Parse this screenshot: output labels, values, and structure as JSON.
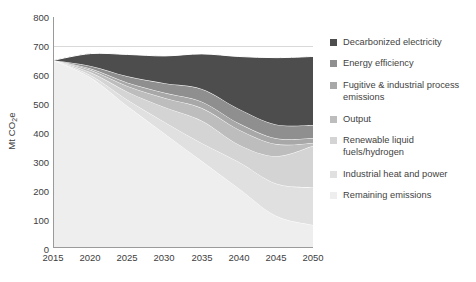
{
  "chart_data": {
    "type": "area",
    "title": "",
    "subtitle": "",
    "xlabel": "",
    "ylabel": "Mt CO2e",
    "ylabel_display": "Mt CO₂e",
    "x": [
      2015,
      2020,
      2025,
      2030,
      2035,
      2040,
      2045,
      2050
    ],
    "xlim": [
      2015,
      2050
    ],
    "ylim": [
      0,
      800
    ],
    "xticks": [
      2015,
      2020,
      2025,
      2030,
      2035,
      2040,
      2045,
      2050
    ],
    "yticks": [
      0,
      100,
      200,
      300,
      400,
      500,
      600,
      700,
      800
    ],
    "grid": "horizontal-only-at-700",
    "stacked": true,
    "stack_order_top_to_bottom": [
      "Decarbonized electricity",
      "Energy efficiency",
      "Fugitive & industrial process emissions",
      "Output",
      "Renewable liquid fuels/hydrogen",
      "Industrial heat and power",
      "Remaining emissions"
    ],
    "legend_position": "right",
    "series": [
      {
        "name": "Remaining emissions",
        "color": "#eeeeee",
        "values": [
          650,
          590,
          490,
          395,
          300,
          205,
          110,
          78
        ]
      },
      {
        "name": "Industrial heat and power",
        "color": "#e0e0e0",
        "values": [
          0,
          8,
          22,
          40,
          62,
          92,
          112,
          130
        ]
      },
      {
        "name": "Renewable liquid fuels/hydrogen",
        "color": "#d4d4d4",
        "values": [
          0,
          10,
          28,
          52,
          78,
          60,
          95,
          145
        ]
      },
      {
        "name": "Output",
        "color": "#bdbdbd",
        "values": [
          0,
          8,
          20,
          32,
          44,
          52,
          42,
          10
        ]
      },
      {
        "name": "Fugitive & industrial process emissions",
        "color": "#a8a8a8",
        "values": [
          0,
          5,
          12,
          18,
          22,
          22,
          20,
          17
        ]
      },
      {
        "name": "Energy efficiency",
        "color": "#8f8f8f",
        "values": [
          0,
          9,
          22,
          33,
          44,
          50,
          48,
          45
        ]
      },
      {
        "name": "Decarbonized electricity",
        "color": "#4d4d4d",
        "values": [
          0,
          43,
          76,
          95,
          122,
          182,
          232,
          238
        ]
      }
    ],
    "series_totals_top_of_stack": [
      650,
      673,
      670,
      665,
      672,
      663,
      659,
      663
    ]
  },
  "axes": {
    "y_title": "Mt CO₂e",
    "y_title_main": "Mt CO",
    "y_title_sub": "2",
    "y_title_tail": "e",
    "y_tick_labels": [
      "800",
      "700",
      "600",
      "500",
      "400",
      "300",
      "200",
      "100",
      "0"
    ],
    "x_tick_labels": [
      "2015",
      "2020",
      "2025",
      "2030",
      "2035",
      "2040",
      "2045",
      "2050"
    ]
  },
  "legend": {
    "items": [
      {
        "label": "Decarbonized electricity",
        "color": "#4d4d4d"
      },
      {
        "label": "Energy efficiency",
        "color": "#8f8f8f"
      },
      {
        "label": "Fugitive & industrial process\nemissions",
        "color": "#a8a8a8"
      },
      {
        "label": "Output",
        "color": "#bdbdbd"
      },
      {
        "label": "Renewable liquid\nfuels/hydrogen",
        "color": "#d4d4d4"
      },
      {
        "label": "Industrial heat and power",
        "color": "#e0e0e0"
      },
      {
        "label": "Remaining emissions",
        "color": "#eeeeee"
      }
    ]
  },
  "colors": {
    "axis_line": "#9a9a9a",
    "gridline": "#d9d9d9",
    "band_separator": "#ffffff",
    "text": "#3f3f3f",
    "background": "#ffffff"
  }
}
